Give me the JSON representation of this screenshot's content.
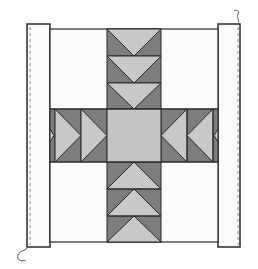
{
  "diagram": {
    "type": "quilt-block",
    "colors": {
      "background": "#ffffff",
      "light_fabric": "#c8c8c8",
      "dark_fabric": "#7d7d7d",
      "center_square": "#c4c4c4",
      "white_fabric": "#fbfbfb",
      "outline": "#2a2a2a",
      "seam_line": "#8a8a8a"
    },
    "units": {
      "top_arm": {
        "geese_count": 3,
        "direction": "down"
      },
      "bottom_arm": {
        "geese_count": 3,
        "direction": "up"
      },
      "left_arm": {
        "geese_count": 2,
        "direction": "right"
      },
      "right_arm": {
        "geese_count": 2,
        "direction": "left"
      },
      "center": "solid square"
    },
    "borders": {
      "left": {
        "seam": "dashed",
        "wavy_end": "bottom"
      },
      "right": {
        "seam": "dashed",
        "wavy_end": "top"
      }
    }
  }
}
